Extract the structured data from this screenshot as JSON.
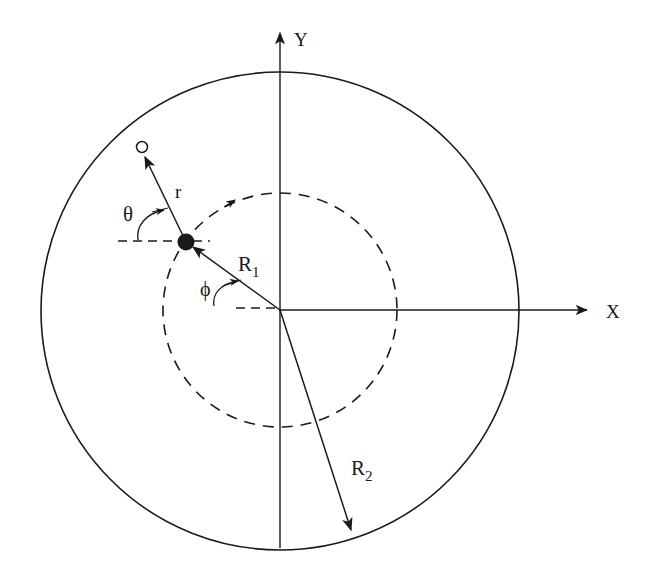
{
  "diagram": {
    "labels": {
      "y_axis": "Y",
      "x_axis": "X",
      "r": "r",
      "theta": "θ",
      "phi": "ϕ",
      "R1_main": "R",
      "R1_sub": "1",
      "R2_main": "R",
      "R2_sub": "2"
    },
    "geometry": {
      "origin": [
        280,
        310
      ],
      "outer_circle_radius": 239,
      "inner_dashed_circle_radius": 117,
      "particle_position": [
        186,
        242
      ],
      "open_point_position": [
        142,
        147
      ],
      "R2_arrow_tip": [
        352,
        532
      ],
      "y_axis_top": [
        280,
        32
      ],
      "x_axis_right": [
        587,
        310
      ]
    },
    "colors": {
      "ink": "#1a1a1a",
      "background": "#ffffff"
    }
  }
}
